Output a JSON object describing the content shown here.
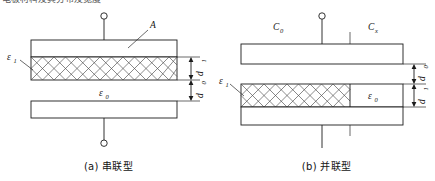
{
  "figure": {
    "clipped_heading": "电极材料及其分布及宽度",
    "panels": [
      {
        "id": "a",
        "caption": "(a)  串联型",
        "labels": {
          "area": "A",
          "dielectric_solid": "ε",
          "dielectric_solid_sub": "1",
          "dielectric_air": "ε",
          "dielectric_air_sub": "0",
          "thickness_solid": "d",
          "thickness_solid_sub": "1",
          "thickness_air": "d",
          "thickness_air_sub": "0"
        }
      },
      {
        "id": "b",
        "caption": "(b)  并联型",
        "labels": {
          "cap_zero": "C",
          "cap_zero_sub": "0",
          "cap_x": "C",
          "cap_x_sub": "x",
          "dielectric_solid": "ε",
          "dielectric_solid_sub": "1",
          "dielectric_air": "ε",
          "dielectric_air_sub": "0",
          "gap_air": "d",
          "gap_air_sub": "0",
          "gap_solid": "d",
          "gap_solid_sub": "1"
        }
      }
    ]
  }
}
